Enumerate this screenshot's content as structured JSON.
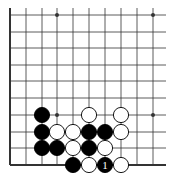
{
  "diagram": {
    "type": "go-board-fragment",
    "grid": {
      "cols_x": [
        10,
        26,
        42,
        57,
        73,
        89,
        105,
        121,
        137,
        153
      ],
      "rows_y": [
        15,
        32,
        48,
        65,
        81,
        98,
        115,
        132,
        148,
        165
      ],
      "right_extent": 166,
      "top_extent": 8,
      "left_edge_is_border": true,
      "bottom_edge_is_border": true
    },
    "colors": {
      "line": "#333333",
      "black_stone": "#000000",
      "white_stone": "#ffffff",
      "stone_outline": "#000000"
    },
    "star_points": [
      {
        "col": 3,
        "row": 0
      },
      {
        "col": 9,
        "row": 0
      },
      {
        "col": 3,
        "row": 6
      },
      {
        "col": 9,
        "row": 6
      }
    ],
    "stones": [
      {
        "col": 2,
        "row": 6,
        "color": "black"
      },
      {
        "col": 5,
        "row": 6,
        "color": "white"
      },
      {
        "col": 7,
        "row": 6,
        "color": "white"
      },
      {
        "col": 2,
        "row": 7,
        "color": "black"
      },
      {
        "col": 3,
        "row": 7,
        "color": "white"
      },
      {
        "col": 4,
        "row": 7,
        "color": "white"
      },
      {
        "col": 5,
        "row": 7,
        "color": "black"
      },
      {
        "col": 6,
        "row": 7,
        "color": "black"
      },
      {
        "col": 7,
        "row": 7,
        "color": "white"
      },
      {
        "col": 2,
        "row": 8,
        "color": "black"
      },
      {
        "col": 3,
        "row": 8,
        "color": "black"
      },
      {
        "col": 4,
        "row": 8,
        "color": "white"
      },
      {
        "col": 5,
        "row": 8,
        "color": "black"
      },
      {
        "col": 6,
        "row": 8,
        "color": "white"
      },
      {
        "col": 4,
        "row": 9,
        "color": "black"
      },
      {
        "col": 5,
        "row": 9,
        "color": "white"
      },
      {
        "col": 6,
        "row": 9,
        "color": "black",
        "label": "1"
      },
      {
        "col": 7,
        "row": 9,
        "color": "white"
      }
    ]
  }
}
